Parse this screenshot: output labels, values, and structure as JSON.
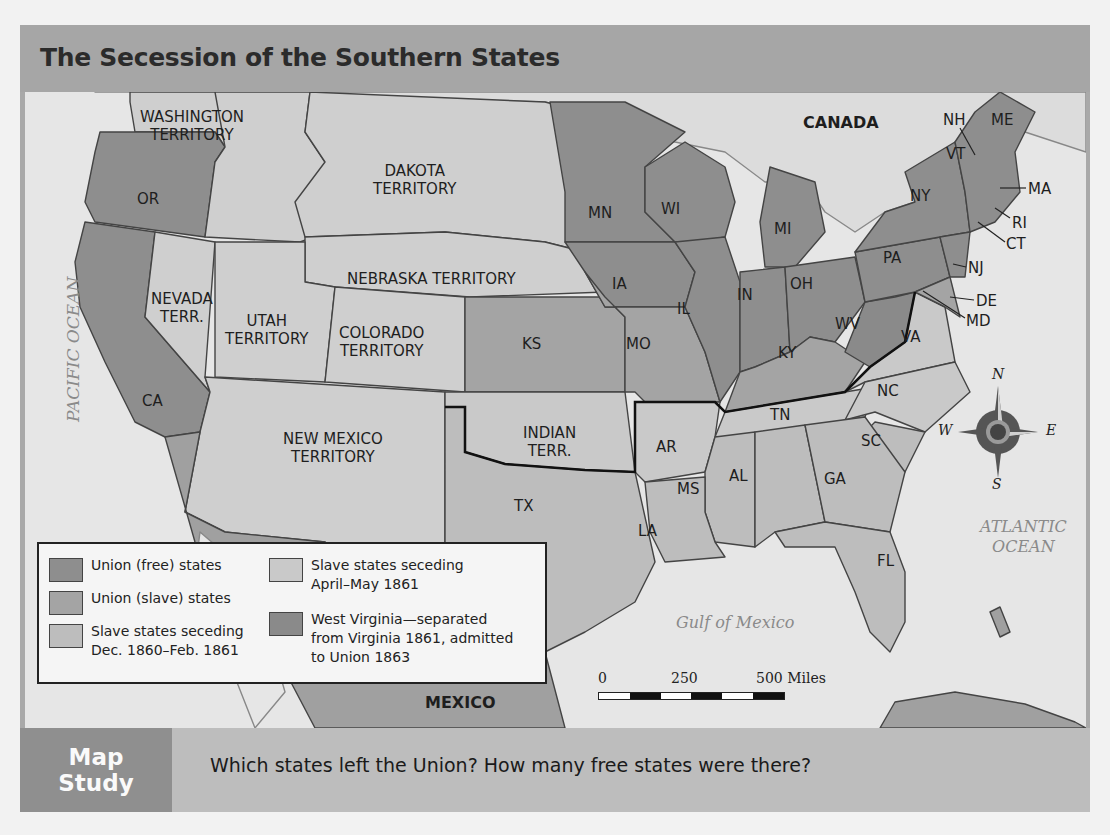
{
  "title": "The Secession of the Southern States",
  "colors": {
    "union_free": "#8e8e8e",
    "union_slave": "#a4a4a4",
    "seceding_early": "#bdbdbd",
    "seceding_late": "#c9c9c9",
    "territory": "#cfcfcf",
    "west_virginia": "#8a8a8a",
    "water": "#e6e6e6",
    "foreign": "#a0a0a0"
  },
  "regions": {
    "canada": "CANADA",
    "mexico": "MEXICO"
  },
  "oceans": {
    "pacific": "PACIFIC OCEAN",
    "atlantic_line1": "ATLANTIC",
    "atlantic_line2": "OCEAN",
    "gulf": "Gulf of Mexico"
  },
  "territories": {
    "washington_1": "WASHINGTON",
    "washington_2": "TERRITORY",
    "dakota_1": "DAKOTA",
    "dakota_2": "TERRITORY",
    "nebraska": "NEBRASKA TERRITORY",
    "nevada_1": "NEVADA",
    "nevada_2": "TERR.",
    "utah_1": "UTAH",
    "utah_2": "TERRITORY",
    "colorado_1": "COLORADO",
    "colorado_2": "TERRITORY",
    "new_mexico_1": "NEW MEXICO",
    "new_mexico_2": "TERRITORY",
    "indian_1": "INDIAN",
    "indian_2": "TERR."
  },
  "states": {
    "OR": "OR",
    "CA": "CA",
    "MN": "MN",
    "WI": "WI",
    "MI": "MI",
    "IA": "IA",
    "IL": "IL",
    "IN": "IN",
    "OH": "OH",
    "KS": "KS",
    "MO": "MO",
    "KY": "KY",
    "WV": "WV",
    "VA": "VA",
    "PA": "PA",
    "NY": "NY",
    "NH": "NH",
    "VT": "VT",
    "ME": "ME",
    "MA": "MA",
    "RI": "RI",
    "CT": "CT",
    "NJ": "NJ",
    "DE": "DE",
    "MD": "MD",
    "NC": "NC",
    "TN": "TN",
    "AR": "AR",
    "SC": "SC",
    "GA": "GA",
    "AL": "AL",
    "MS": "MS",
    "LA": "LA",
    "TX": "TX",
    "FL": "FL"
  },
  "legend": {
    "items": [
      {
        "label": "Union (free) states",
        "color": "#8e8e8e"
      },
      {
        "label": "Union (slave) states",
        "color": "#a4a4a4"
      },
      {
        "label": "Slave states seceding Dec. 1860–Feb. 1861",
        "line1": "Slave states seceding",
        "line2": "Dec. 1860–Feb. 1861",
        "color": "#bdbdbd"
      },
      {
        "label": "Slave states seceding April–May 1861",
        "line1": "Slave states seceding",
        "line2": "April–May 1861",
        "color": "#c9c9c9"
      },
      {
        "label": "West Virginia—separated from Virginia 1861, admitted to Union 1863",
        "line1": "West Virginia—separated",
        "line2": "from Virginia 1861, admitted",
        "line3": "to Union 1863",
        "color": "#8a8a8a"
      }
    ]
  },
  "scale": {
    "ticks": [
      "0",
      "250",
      "500 Miles"
    ]
  },
  "compass": {
    "n": "N",
    "s": "S",
    "e": "E",
    "w": "W"
  },
  "footer": {
    "badge_line1": "Map",
    "badge_line2": "Study",
    "question": "Which states left the Union? How many free states were there?"
  }
}
